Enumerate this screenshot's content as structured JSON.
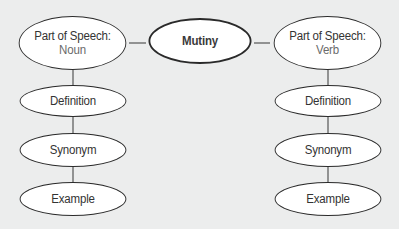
{
  "diagram": {
    "center": {
      "label": "Mutiny"
    },
    "left": {
      "root": {
        "line1": "Part of Speech:",
        "line2": "Noun"
      },
      "children": [
        {
          "label": "Definition"
        },
        {
          "label": "Synonym"
        },
        {
          "label": "Example"
        }
      ]
    },
    "right": {
      "root": {
        "line1": "Part of Speech:",
        "line2": "Verb"
      },
      "children": [
        {
          "label": "Definition"
        },
        {
          "label": "Synonym"
        },
        {
          "label": "Example"
        }
      ]
    }
  },
  "colors": {
    "background": "#eceded",
    "node_fill": "#ffffff",
    "stroke": "#2a2a2a",
    "sub_text": "#6a6a6a"
  }
}
